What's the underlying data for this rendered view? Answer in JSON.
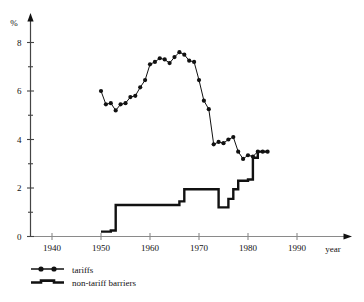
{
  "chart_data": {
    "type": "line",
    "title": "",
    "subtitle": "",
    "xlabel": "year",
    "ylabel": "%",
    "xlim": [
      1935,
      1998
    ],
    "ylim": [
      0,
      8.8
    ],
    "grid": false,
    "legend_position": "bottom-left",
    "x_ticks": [
      1940,
      1950,
      1960,
      1970,
      1980,
      1990
    ],
    "x_tick_labels": [
      "1940",
      "1950",
      "1960",
      "1970",
      "1980",
      "1990"
    ],
    "y_ticks": [
      0,
      1,
      2,
      3,
      4,
      5,
      6,
      7,
      8
    ],
    "y_tick_labels": [
      "0",
      "",
      "2",
      "",
      "4",
      "",
      "6",
      "",
      "8"
    ],
    "y_labeled_ticks": [
      0,
      2,
      4,
      6,
      8
    ],
    "axis_style": "arrow-tipped",
    "series": [
      {
        "name": "tariffs",
        "marker": "filled-circle",
        "line_width": 1,
        "color": "#111111",
        "x": [
          1950,
          1951,
          1952,
          1953,
          1954,
          1955,
          1956,
          1957,
          1958,
          1959,
          1960,
          1961,
          1962,
          1963,
          1964,
          1965,
          1966,
          1967,
          1968,
          1969,
          1970,
          1971,
          1972,
          1973,
          1974,
          1975,
          1976,
          1977,
          1978,
          1979,
          1980,
          1981,
          1982,
          1983,
          1984
        ],
        "values": [
          6.0,
          5.45,
          5.5,
          5.2,
          5.45,
          5.5,
          5.75,
          5.8,
          6.15,
          6.45,
          7.1,
          7.2,
          7.35,
          7.3,
          7.15,
          7.4,
          7.6,
          7.5,
          7.25,
          7.2,
          6.45,
          5.6,
          5.25,
          3.8,
          3.9,
          3.85,
          4.0,
          4.1,
          3.5,
          3.2,
          3.35,
          3.3,
          3.5,
          3.5,
          3.5
        ]
      },
      {
        "name": "non-tariff barriers",
        "marker": "none",
        "line_width": 2.4,
        "color": "#111111",
        "style": "step",
        "x": [
          1950,
          1951,
          1952,
          1953,
          1954,
          1955,
          1956,
          1957,
          1958,
          1959,
          1960,
          1961,
          1962,
          1963,
          1964,
          1965,
          1966,
          1967,
          1968,
          1969,
          1970,
          1971,
          1972,
          1973,
          1974,
          1975,
          1976,
          1977,
          1978,
          1979,
          1980,
          1981,
          1982,
          1983,
          1984
        ],
        "values": [
          0.2,
          0.2,
          0.25,
          1.3,
          1.3,
          1.3,
          1.3,
          1.3,
          1.3,
          1.3,
          1.3,
          1.3,
          1.3,
          1.3,
          1.3,
          1.3,
          1.45,
          1.95,
          1.95,
          1.95,
          1.95,
          1.95,
          1.95,
          1.95,
          1.2,
          1.2,
          1.55,
          1.95,
          2.3,
          2.3,
          2.35,
          3.25,
          3.5,
          3.5,
          3.5
        ]
      }
    ],
    "legend": [
      {
        "label": "tariffs",
        "marker": "line-with-dots"
      },
      {
        "label": "non-tariff barriers",
        "marker": "thick-line"
      }
    ]
  }
}
